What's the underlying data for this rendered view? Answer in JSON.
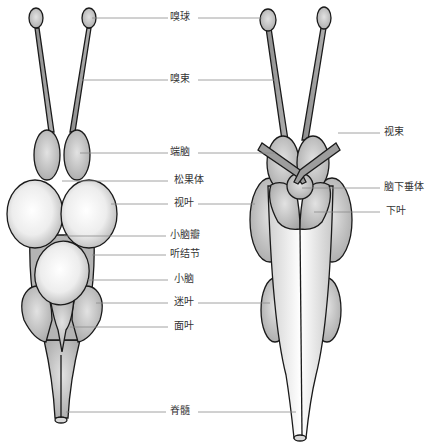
{
  "diagram": {
    "views": [
      "dorsal view",
      "ventral view"
    ],
    "colors": {
      "tissue_dark": "#9a9a9a",
      "tissue_mid": "#c4c4c4",
      "tissue_light": "#f4f4f4",
      "outline": "#1a1a1a",
      "leader": "#8a8a8a"
    },
    "center_labels": [
      {
        "id": "olfactory-bulb",
        "text": "嗅球"
      },
      {
        "id": "olfactory-tract",
        "text": "嗅束"
      },
      {
        "id": "telencephalon",
        "text": "端脑"
      },
      {
        "id": "pineal-body",
        "text": "松果体"
      },
      {
        "id": "optic-lobe",
        "text": "视叶"
      },
      {
        "id": "cerebellar-valve",
        "text": "小脑瓣"
      },
      {
        "id": "auditory-tubercle",
        "text": "听结节"
      },
      {
        "id": "cerebellum",
        "text": "小脑"
      },
      {
        "id": "vagal-lobe",
        "text": "迷叶"
      },
      {
        "id": "facial-lobe",
        "text": "面叶"
      },
      {
        "id": "spinal-cord",
        "text": "脊髓"
      }
    ],
    "right_labels": [
      {
        "id": "optic-tract",
        "text": "视束"
      },
      {
        "id": "hypophysis",
        "text": "脑下垂体"
      },
      {
        "id": "inferior-lobe",
        "text": "下叶"
      }
    ]
  }
}
